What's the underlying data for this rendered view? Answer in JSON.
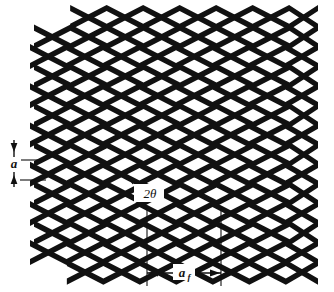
{
  "figure": {
    "name": "expanded-metal-mesh-geometry",
    "background_color": "#ffffff",
    "strand_color": "#111111",
    "annotation_color": "#111111",
    "labels": {
      "strand_pitch": "a",
      "apex_angle": "2θ",
      "long_way_pitch": "a",
      "long_way_pitch_subscript": "f"
    }
  },
  "chart_data": {
    "type": "diagram",
    "title": "",
    "xlabel": "",
    "ylabel": "",
    "mesh": {
      "rows": 14,
      "columns": 5,
      "row_pitch_px": 19.6,
      "column_pitch_px": 73,
      "strand_thickness_px": 6.2,
      "left_edge_px": 30,
      "right_edge_px": 318,
      "top_edge_px": 8,
      "bottom_edge_px": 250,
      "row_stagger_px": 4
    },
    "annotations": [
      {
        "name": "strand-pitch-a",
        "label": "a",
        "type": "vertical-double-arrow",
        "x_px": 14,
        "y_top_px": 140,
        "y_bottom_px": 187,
        "leader_lines": [
          {
            "y_px": 160,
            "x_start_px": 20,
            "x_end_px": 46
          },
          {
            "y_px": 180,
            "x_start_px": 20,
            "x_end_px": 46
          }
        ]
      },
      {
        "name": "apex-angle-2theta",
        "label": "2θ",
        "type": "angle-callout",
        "box_x_px": 134,
        "box_y_px": 184,
        "box_w_px": 30,
        "box_h_px": 18,
        "tick_x_px": 133,
        "tick_y_px": 184
      },
      {
        "name": "long-way-pitch-af",
        "label": "a",
        "subscript": "f",
        "type": "horizontal-double-arrow",
        "y_px": 273,
        "x_left_px": 147,
        "x_right_px": 221,
        "extension_lines": [
          {
            "x_px": 147,
            "y_start_px": 207,
            "y_end_px": 286
          },
          {
            "x_px": 221,
            "y_start_px": 207,
            "y_end_px": 286
          }
        ]
      }
    ]
  }
}
